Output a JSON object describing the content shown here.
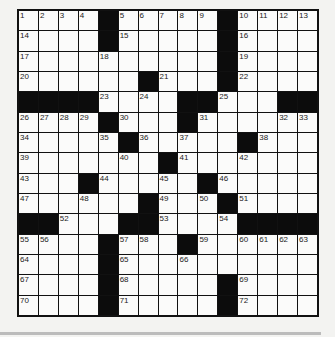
{
  "puzzle": {
    "rows": 15,
    "cols": 15,
    "grid": [
      [
        "1",
        "2",
        "3",
        "4",
        "#",
        "5",
        "6",
        "7",
        "8",
        "9",
        "#",
        "10",
        "11",
        "12",
        "13"
      ],
      [
        "14",
        ".",
        ".",
        ".",
        "#",
        "15",
        ".",
        ".",
        ".",
        ".",
        "#",
        "16",
        ".",
        ".",
        "."
      ],
      [
        "17",
        ".",
        ".",
        ".",
        "18",
        ".",
        ".",
        ".",
        ".",
        ".",
        "#",
        "19",
        ".",
        ".",
        "."
      ],
      [
        "20",
        ".",
        ".",
        ".",
        ".",
        ".",
        "#",
        "21",
        ".",
        ".",
        "#",
        "22",
        ".",
        ".",
        "."
      ],
      [
        "#",
        "#",
        "#",
        "#",
        "23",
        ".",
        "24",
        ".",
        "#",
        "#",
        "25",
        ".",
        ".",
        "#",
        "#"
      ],
      [
        "26",
        "27",
        "28",
        "29",
        "#",
        "30",
        ".",
        ".",
        "#",
        "31",
        ".",
        ".",
        ".",
        "32",
        "33"
      ],
      [
        "34",
        ".",
        ".",
        ".",
        "35",
        "#",
        "36",
        ".",
        "37",
        ".",
        ".",
        "#",
        "38",
        ".",
        "."
      ],
      [
        "39",
        ".",
        ".",
        ".",
        ".",
        "40",
        ".",
        "#",
        "41",
        ".",
        ".",
        "42",
        ".",
        ".",
        "."
      ],
      [
        "43",
        ".",
        ".",
        "#",
        "44",
        ".",
        ".",
        "45",
        ".",
        "#",
        "46",
        ".",
        ".",
        ".",
        "."
      ],
      [
        "47",
        ".",
        ".",
        "48",
        ".",
        ".",
        "#",
        "49",
        ".",
        "50",
        "#",
        "51",
        ".",
        ".",
        "."
      ],
      [
        "#",
        "#",
        "52",
        ".",
        ".",
        "#",
        "#",
        "53",
        ".",
        ".",
        "54",
        "#",
        "#",
        "#",
        "#"
      ],
      [
        "55",
        "56",
        ".",
        ".",
        "#",
        "57",
        "58",
        ".",
        "#",
        "59",
        ".",
        "60",
        "61",
        "62",
        "63"
      ],
      [
        "64",
        ".",
        ".",
        ".",
        "#",
        "65",
        ".",
        ".",
        "66",
        ".",
        ".",
        ".",
        ".",
        ".",
        "."
      ],
      [
        "67",
        ".",
        ".",
        ".",
        "#",
        "68",
        ".",
        ".",
        ".",
        ".",
        "#",
        "69",
        ".",
        ".",
        "."
      ],
      [
        "70",
        ".",
        ".",
        ".",
        "#",
        "71",
        ".",
        ".",
        ".",
        ".",
        "#",
        "72",
        ".",
        ".",
        "."
      ]
    ]
  },
  "colors": {
    "block": "#0c0c0c",
    "cell": "#fbfbfa",
    "background": "#f3f3f1",
    "bar": "#bcbcbc"
  }
}
